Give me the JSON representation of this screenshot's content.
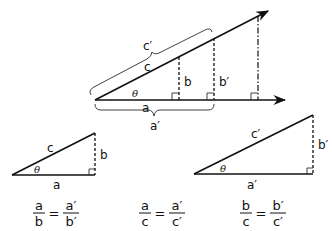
{
  "diagram": {
    "main_figure": {
      "labels": {
        "hyp_small": "c",
        "hyp_large": "c′",
        "opp_small": "b",
        "opp_large": "b′",
        "adj_small": "a",
        "adj_large": "a′",
        "angle": "θ"
      }
    },
    "triangle_small": {
      "hyp": "c",
      "opp": "b",
      "adj": "a",
      "angle": "θ"
    },
    "triangle_large": {
      "hyp": "c′",
      "opp": "b′",
      "adj": "a′",
      "angle": "θ"
    },
    "equations": [
      {
        "num1": "a",
        "den1": "b",
        "eq": "=",
        "num2": "a′",
        "den2": "b′"
      },
      {
        "num1": "a",
        "den1": "c",
        "eq": "=",
        "num2": "a′",
        "den2": "c′"
      },
      {
        "num1": "b",
        "den1": "c",
        "eq": "=",
        "num2": "b′",
        "den2": "c′"
      }
    ],
    "colors": {
      "line": "#111111",
      "background": "#ffffff"
    }
  }
}
